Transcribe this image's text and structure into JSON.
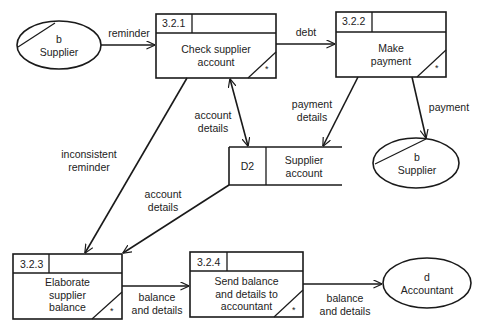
{
  "diagram": {
    "type": "data-flow-diagram",
    "processes": [
      {
        "id": "3.2.1",
        "title": "Check supplier account",
        "line1": "Check supplier",
        "line2": "account",
        "line3": "",
        "marker": "*"
      },
      {
        "id": "3.2.2",
        "title": "Make payment",
        "line1": "Make",
        "line2": "payment",
        "line3": "",
        "marker": "*"
      },
      {
        "id": "3.2.3",
        "title": "Elaborate supplier balance",
        "line1": "Elaborate",
        "line2": "supplier",
        "line3": "balance",
        "marker": "*"
      },
      {
        "id": "3.2.4",
        "title": "Send balance and details to accountant",
        "line1": "Send balance",
        "line2": "and details to",
        "line3": "accountant",
        "marker": "*"
      }
    ],
    "externals": [
      {
        "key": "supplier_left",
        "code": "b",
        "name": "Supplier"
      },
      {
        "key": "supplier_right",
        "code": "b",
        "name": "Supplier"
      },
      {
        "key": "accountant",
        "code": "d",
        "name": "Accountant"
      }
    ],
    "datastores": [
      {
        "id": "D2",
        "name_line1": "Supplier",
        "name_line2": "account"
      }
    ],
    "flows": [
      {
        "from": "b Supplier",
        "to": "3.2.1",
        "label_line1": "reminder",
        "label_line2": ""
      },
      {
        "from": "3.2.1",
        "to": "3.2.2",
        "label_line1": "debt",
        "label_line2": ""
      },
      {
        "from": "3.2.1",
        "to": "D2",
        "label_line1": "account",
        "label_line2": "details",
        "bidirectional": true
      },
      {
        "from": "3.2.2",
        "to": "D2",
        "label_line1": "payment",
        "label_line2": "details"
      },
      {
        "from": "3.2.2",
        "to": "b Supplier",
        "label_line1": "payment",
        "label_line2": ""
      },
      {
        "from": "3.2.1",
        "to": "3.2.3",
        "label_line1": "inconsistent",
        "label_line2": "reminder"
      },
      {
        "from": "D2",
        "to": "3.2.3",
        "label_line1": "account",
        "label_line2": "details"
      },
      {
        "from": "3.2.3",
        "to": "3.2.4",
        "label_line1": "balance",
        "label_line2": "and details"
      },
      {
        "from": "3.2.4",
        "to": "d Accountant",
        "label_line1": "balance",
        "label_line2": "and details"
      }
    ]
  }
}
